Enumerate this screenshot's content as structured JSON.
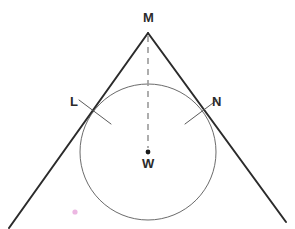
{
  "figure": {
    "background_color": "#ffffff",
    "width": 295,
    "height": 229,
    "labels": {
      "apex": "M",
      "tangent_point_left": "L",
      "tangent_point_right": "N",
      "center": "W"
    },
    "colors": {
      "tangent_line": "#2b2b2b",
      "circle_stroke": "#6b6b6b",
      "dashed_line": "#9a9a9a",
      "center_dot": "#1a1a1a",
      "tick_mark": "#5a5a5a",
      "stray_dot": "#e59fd8",
      "label_text": "#2b2b2b"
    },
    "geometry": {
      "apex_point": {
        "x": 148,
        "y": 32
      },
      "circle": {
        "cx": 148,
        "cy": 152,
        "r": 68
      },
      "tangent_point_left": {
        "x": 93,
        "y": 112
      },
      "tangent_point_right": {
        "x": 203,
        "y": 112
      },
      "left_line_end": {
        "x": 9,
        "y": 228
      },
      "right_line_end": {
        "x": 286,
        "y": 222
      },
      "dashed_line": {
        "x1": 148,
        "y1": 36,
        "x2": 148,
        "y2": 148
      },
      "center_dot_radius": 2.4,
      "tick_left": {
        "x1": 79,
        "y1": 100,
        "x2": 111,
        "y2": 124
      },
      "tick_right": {
        "x1": 217,
        "y1": 100,
        "x2": 185,
        "y2": 124
      },
      "stray_dot": {
        "x": 75,
        "y": 212,
        "r": 2.6
      }
    },
    "stroke_widths": {
      "tangent_line": 2.0,
      "circle": 1.0,
      "dashed_line": 1.6,
      "tick_mark": 1.0
    },
    "dash_pattern": "6 5"
  }
}
